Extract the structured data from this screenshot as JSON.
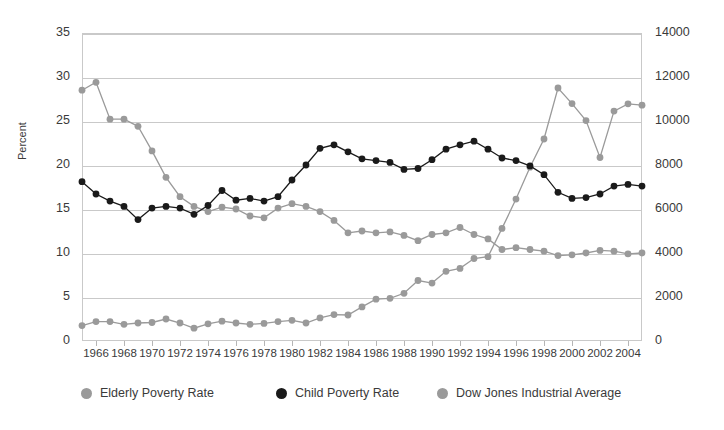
{
  "chart_data": {
    "type": "line",
    "title": "",
    "xlabel": "",
    "ylabel": "Percent",
    "ylabel_right": "",
    "grid": true,
    "legend_position": "bottom",
    "x": [
      1965,
      1966,
      1967,
      1968,
      1969,
      1970,
      1971,
      1972,
      1973,
      1974,
      1975,
      1976,
      1977,
      1978,
      1979,
      1980,
      1981,
      1982,
      1983,
      1984,
      1985,
      1986,
      1987,
      1988,
      1989,
      1990,
      1991,
      1992,
      1993,
      1994,
      1995,
      1996,
      1997,
      1998,
      1999,
      2000,
      2001,
      2002,
      2003,
      2004,
      2005
    ],
    "xtick_labels": [
      "1966",
      "1968",
      "1970",
      "1972",
      "1974",
      "1976",
      "1978",
      "1980",
      "1982",
      "1984",
      "1986",
      "1988",
      "1990",
      "1992",
      "1994",
      "1996",
      "1998",
      "2000",
      "2002",
      "2004"
    ],
    "xtick_values": [
      1966,
      1968,
      1970,
      1972,
      1974,
      1976,
      1978,
      1980,
      1982,
      1984,
      1986,
      1988,
      1990,
      1992,
      1994,
      1996,
      1998,
      2000,
      2002,
      2004
    ],
    "xlim": [
      1965,
      2005
    ],
    "left_axis": {
      "label": "Percent",
      "ticks": [
        0,
        5,
        10,
        15,
        20,
        25,
        30,
        35
      ],
      "tick_labels": [
        "0",
        "5",
        "10",
        "15",
        "20",
        "25",
        "30",
        "35"
      ],
      "ylim": [
        0,
        35
      ]
    },
    "right_axis": {
      "label": "",
      "ticks": [
        0,
        2000,
        4000,
        6000,
        8000,
        10000,
        12000,
        14000
      ],
      "tick_labels": [
        "0",
        "2000",
        "4000",
        "6000",
        "8000",
        "10000",
        "12000",
        "14000"
      ],
      "ylim": [
        0,
        14000
      ]
    },
    "series": [
      {
        "name": "Elderly Poverty Rate",
        "axis": "left",
        "color": "#9a9a9a",
        "marker": "circle",
        "values": [
          28.5,
          29.4,
          25.2,
          25.2,
          24.4,
          21.6,
          18.6,
          16.4,
          15.3,
          14.7,
          15.2,
          15.0,
          14.2,
          14.0,
          15.1,
          15.6,
          15.3,
          14.7,
          13.7,
          12.3,
          12.5,
          12.3,
          12.4,
          12.0,
          11.4,
          12.1,
          12.3,
          12.9,
          12.1,
          11.6,
          10.4,
          10.6,
          10.4,
          10.2,
          9.7,
          9.8,
          10.0,
          10.3,
          10.2,
          9.9,
          10.0
        ]
      },
      {
        "name": "Child Poverty Rate",
        "axis": "left",
        "color": "#1a1a1a",
        "marker": "circle",
        "values": [
          18.1,
          16.7,
          15.9,
          15.3,
          13.8,
          15.1,
          15.3,
          15.1,
          14.4,
          15.4,
          17.1,
          16.0,
          16.2,
          15.9,
          16.4,
          18.3,
          20.0,
          21.9,
          22.3,
          21.5,
          20.7,
          20.5,
          20.3,
          19.5,
          19.6,
          20.6,
          21.8,
          22.3,
          22.7,
          21.8,
          20.8,
          20.5,
          19.9,
          18.9,
          16.9,
          16.2,
          16.3,
          16.7,
          17.6,
          17.8,
          17.6
        ]
      },
      {
        "name": "Dow Jones Industrial Average",
        "axis": "right",
        "color": "#9a9a9a",
        "marker": "circle",
        "values": [
          700,
          880,
          880,
          760,
          820,
          840,
          1000,
          820,
          580,
          780,
          900,
          820,
          760,
          800,
          880,
          940,
          820,
          1050,
          1200,
          1180,
          1550,
          1900,
          1940,
          2170,
          2750,
          2630,
          3170,
          3300,
          3750,
          3830,
          5120,
          6450,
          7900,
          9180,
          11500,
          10790,
          10020,
          8340,
          10450,
          10780,
          10720
        ]
      }
    ]
  },
  "legend": {
    "items": [
      {
        "label": "Elderly Poverty Rate",
        "color": "#9a9a9a"
      },
      {
        "label": "Child Poverty Rate",
        "color": "#1a1a1a"
      },
      {
        "label": "Dow Jones Industrial Average",
        "color": "#9a9a9a"
      }
    ]
  },
  "colors": {
    "grid": "#c9c9c9",
    "frame": "#c9c9c9",
    "text": "#3a3a3a",
    "gray_series": "#9a9a9a",
    "black_series": "#1a1a1a",
    "background": "#ffffff"
  }
}
